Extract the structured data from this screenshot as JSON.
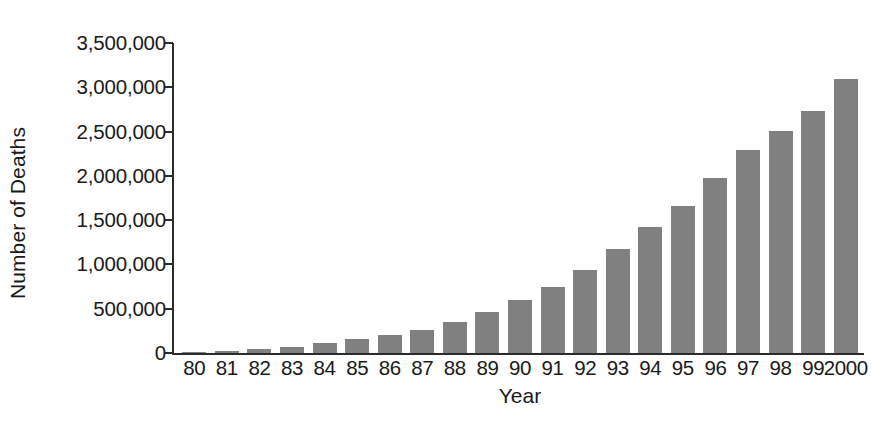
{
  "chart_data": {
    "type": "bar",
    "title": "",
    "xlabel": "Year",
    "ylabel": "Number of Deaths",
    "categories": [
      "80",
      "81",
      "82",
      "83",
      "84",
      "85",
      "86",
      "87",
      "88",
      "89",
      "90",
      "91",
      "92",
      "93",
      "94",
      "95",
      "96",
      "97",
      "98",
      "99",
      "2000"
    ],
    "values": [
      10000,
      25000,
      45000,
      70000,
      110000,
      155000,
      205000,
      265000,
      350000,
      460000,
      600000,
      745000,
      940000,
      1170000,
      1420000,
      1660000,
      1980000,
      2290000,
      2510000,
      2730000,
      3090000
    ],
    "ylim": [
      0,
      3500000
    ],
    "ytick_values": [
      0,
      500000,
      1000000,
      1500000,
      2000000,
      2500000,
      3000000,
      3500000
    ],
    "ytick_labels": [
      "0",
      "500,000",
      "1,000,000",
      "1,500,000",
      "2,000,000",
      "2,500,000",
      "3,000,000",
      "3,500,000"
    ],
    "grid": false,
    "legend": null,
    "bar_color": "#808080",
    "axis_color": "#2b2b2b",
    "background_color": "#ffffff"
  }
}
